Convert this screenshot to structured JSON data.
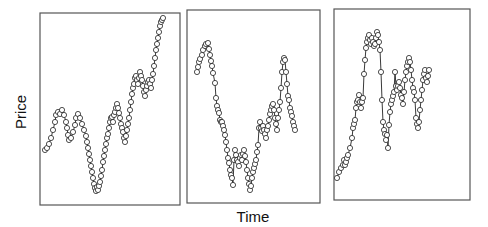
{
  "chart_data": {
    "type": "line",
    "title": "",
    "xlabel": "Time",
    "ylabel": "Price",
    "grid": false,
    "legend": null,
    "markers": "open-circle",
    "axis_ticks": false,
    "panels": [
      {
        "name": "panel-1",
        "frame": [
          40,
          13,
          180,
          205
        ],
        "points": [
          [
            45,
            150
          ],
          [
            47,
            148
          ],
          [
            49,
            144
          ],
          [
            51,
            138
          ],
          [
            53,
            130
          ],
          [
            55,
            122
          ],
          [
            56,
            115
          ],
          [
            58,
            112
          ],
          [
            60,
            114
          ],
          [
            62,
            110
          ],
          [
            64,
            115
          ],
          [
            66,
            122
          ],
          [
            67,
            128
          ],
          [
            68,
            135
          ],
          [
            69,
            140
          ],
          [
            71,
            138
          ],
          [
            73,
            132
          ],
          [
            75,
            125
          ],
          [
            76,
            118
          ],
          [
            78,
            114
          ],
          [
            80,
            118
          ],
          [
            82,
            124
          ],
          [
            84,
            130
          ],
          [
            86,
            136
          ],
          [
            87,
            142
          ],
          [
            88,
            148
          ],
          [
            89,
            154
          ],
          [
            90,
            160
          ],
          [
            91,
            166
          ],
          [
            92,
            172
          ],
          [
            93,
            178
          ],
          [
            94,
            184
          ],
          [
            95,
            188
          ],
          [
            96,
            191
          ],
          [
            97,
            187
          ],
          [
            98,
            190
          ],
          [
            99,
            186
          ],
          [
            100,
            182
          ],
          [
            101,
            176
          ],
          [
            102,
            170
          ],
          [
            103,
            162
          ],
          [
            104,
            156
          ],
          [
            105,
            150
          ],
          [
            106,
            144
          ],
          [
            107,
            138
          ],
          [
            108,
            134
          ],
          [
            109,
            128
          ],
          [
            110,
            122
          ],
          [
            111,
            118
          ],
          [
            112,
            117
          ],
          [
            113,
            122
          ],
          [
            114,
            115
          ],
          [
            115,
            112
          ],
          [
            116,
            108
          ],
          [
            117,
            104
          ],
          [
            118,
            108
          ],
          [
            119,
            113
          ],
          [
            120,
            118
          ],
          [
            121,
            124
          ],
          [
            122,
            128
          ],
          [
            123,
            132
          ],
          [
            124,
            138
          ],
          [
            125,
            142
          ],
          [
            126,
            136
          ],
          [
            127,
            130
          ],
          [
            128,
            124
          ],
          [
            129,
            118
          ],
          [
            130,
            110
          ],
          [
            131,
            102
          ],
          [
            132,
            94
          ],
          [
            133,
            88
          ],
          [
            134,
            84
          ],
          [
            135,
            78
          ],
          [
            136,
            76
          ],
          [
            137,
            80
          ],
          [
            138,
            84
          ],
          [
            139,
            78
          ],
          [
            140,
            72
          ],
          [
            141,
            76
          ],
          [
            142,
            80
          ],
          [
            143,
            86
          ],
          [
            144,
            92
          ],
          [
            145,
            96
          ],
          [
            146,
            90
          ],
          [
            147,
            86
          ],
          [
            148,
            82
          ],
          [
            149,
            80
          ],
          [
            150,
            84
          ],
          [
            151,
            88
          ],
          [
            152,
            80
          ],
          [
            153,
            74
          ],
          [
            154,
            66
          ],
          [
            155,
            58
          ],
          [
            156,
            50
          ],
          [
            157,
            44
          ],
          [
            158,
            38
          ],
          [
            159,
            32
          ],
          [
            160,
            26
          ],
          [
            161,
            22
          ],
          [
            162,
            20
          ],
          [
            163,
            18
          ]
        ]
      },
      {
        "name": "panel-2",
        "frame": [
          187,
          10,
          320,
          203
        ],
        "points": [
          [
            197,
            72
          ],
          [
            198,
            67
          ],
          [
            199,
            62
          ],
          [
            200,
            59
          ],
          [
            202,
            55
          ],
          [
            203,
            50
          ],
          [
            205,
            46
          ],
          [
            206,
            44
          ],
          [
            208,
            43
          ],
          [
            209,
            49
          ],
          [
            210,
            55
          ],
          [
            211,
            61
          ],
          [
            212,
            66
          ],
          [
            213,
            73
          ],
          [
            215,
            83
          ],
          [
            216,
            98
          ],
          [
            217,
            106
          ],
          [
            218,
            110
          ],
          [
            219,
            113
          ],
          [
            220,
            120
          ],
          [
            221,
            122
          ],
          [
            222,
            122
          ],
          [
            223,
            126
          ],
          [
            224,
            130
          ],
          [
            225,
            135
          ],
          [
            226,
            142
          ],
          [
            227,
            150
          ],
          [
            228,
            158
          ],
          [
            229,
            163
          ],
          [
            230,
            170
          ],
          [
            231,
            175
          ],
          [
            232,
            178
          ],
          [
            233,
            185
          ],
          [
            234,
            160
          ],
          [
            235,
            150
          ],
          [
            236,
            155
          ],
          [
            237,
            160
          ],
          [
            238,
            162
          ],
          [
            239,
            166
          ],
          [
            240,
            158
          ],
          [
            241,
            155
          ],
          [
            242,
            160
          ],
          [
            243,
            154
          ],
          [
            244,
            150
          ],
          [
            245,
            156
          ],
          [
            246,
            162
          ],
          [
            247,
            170
          ],
          [
            248,
            178
          ],
          [
            249,
            184
          ],
          [
            250,
            190
          ],
          [
            251,
            186
          ],
          [
            252,
            178
          ],
          [
            253,
            172
          ],
          [
            254,
            168
          ],
          [
            255,
            164
          ],
          [
            256,
            160
          ],
          [
            257,
            152
          ],
          [
            258,
            145
          ],
          [
            259,
            128
          ],
          [
            260,
            122
          ],
          [
            261,
            128
          ],
          [
            262,
            131
          ],
          [
            263,
            126
          ],
          [
            264,
            130
          ],
          [
            265,
            134
          ],
          [
            266,
            138
          ],
          [
            267,
            130
          ],
          [
            268,
            126
          ],
          [
            269,
            120
          ],
          [
            270,
            114
          ],
          [
            271,
            110
          ],
          [
            272,
            106
          ],
          [
            273,
            104
          ],
          [
            274,
            110
          ],
          [
            275,
            118
          ],
          [
            276,
            124
          ],
          [
            277,
            130
          ],
          [
            278,
            118
          ],
          [
            279,
            110
          ],
          [
            280,
            102
          ],
          [
            281,
            88
          ],
          [
            282,
            72
          ],
          [
            283,
            62
          ],
          [
            284,
            58
          ],
          [
            285,
            60
          ],
          [
            286,
            72
          ],
          [
            287,
            84
          ],
          [
            288,
            96
          ],
          [
            289,
            100
          ],
          [
            290,
            108
          ],
          [
            291,
            112
          ],
          [
            292,
            116
          ],
          [
            293,
            122
          ],
          [
            294,
            126
          ],
          [
            295,
            130
          ]
        ]
      },
      {
        "name": "panel-3",
        "frame": [
          334,
          9,
          470,
          200
        ],
        "points": [
          [
            337,
            178
          ],
          [
            339,
            172
          ],
          [
            341,
            168
          ],
          [
            343,
            165
          ],
          [
            344,
            160
          ],
          [
            345,
            165
          ],
          [
            346,
            162
          ],
          [
            347,
            158
          ],
          [
            348,
            155
          ],
          [
            350,
            148
          ],
          [
            352,
            138
          ],
          [
            353,
            128
          ],
          [
            354,
            124
          ],
          [
            355,
            120
          ],
          [
            356,
            108
          ],
          [
            357,
            102
          ],
          [
            358,
            100
          ],
          [
            359,
            95
          ],
          [
            360,
            102
          ],
          [
            361,
            108
          ],
          [
            362,
            102
          ],
          [
            363,
            98
          ],
          [
            364,
            74
          ],
          [
            365,
            60
          ],
          [
            366,
            48
          ],
          [
            367,
            42
          ],
          [
            368,
            38
          ],
          [
            369,
            35
          ],
          [
            370,
            40
          ],
          [
            371,
            44
          ],
          [
            372,
            38
          ],
          [
            373,
            42
          ],
          [
            374,
            46
          ],
          [
            375,
            44
          ],
          [
            376,
            38
          ],
          [
            377,
            32
          ],
          [
            378,
            35
          ],
          [
            379,
            42
          ],
          [
            380,
            50
          ],
          [
            381,
            72
          ],
          [
            382,
            100
          ],
          [
            383,
            122
          ],
          [
            384,
            130
          ],
          [
            385,
            134
          ],
          [
            386,
            140
          ],
          [
            387,
            135
          ],
          [
            388,
            148
          ],
          [
            389,
            125
          ],
          [
            390,
            112
          ],
          [
            391,
            104
          ],
          [
            392,
            100
          ],
          [
            393,
            96
          ],
          [
            394,
            92
          ],
          [
            395,
            72
          ],
          [
            396,
            86
          ],
          [
            397,
            90
          ],
          [
            398,
            86
          ],
          [
            399,
            82
          ],
          [
            400,
            88
          ],
          [
            401,
            95
          ],
          [
            402,
            98
          ],
          [
            403,
            104
          ],
          [
            404,
            92
          ],
          [
            405,
            80
          ],
          [
            406,
            72
          ],
          [
            407,
            66
          ],
          [
            408,
            62
          ],
          [
            409,
            58
          ],
          [
            410,
            62
          ],
          [
            411,
            70
          ],
          [
            412,
            80
          ],
          [
            413,
            88
          ],
          [
            414,
            92
          ],
          [
            415,
            100
          ],
          [
            416,
            118
          ],
          [
            417,
            124
          ],
          [
            418,
            128
          ],
          [
            419,
            122
          ],
          [
            420,
            110
          ],
          [
            421,
            100
          ],
          [
            422,
            90
          ],
          [
            423,
            80
          ],
          [
            424,
            74
          ],
          [
            425,
            70
          ],
          [
            426,
            78
          ],
          [
            427,
            82
          ],
          [
            428,
            76
          ],
          [
            429,
            70
          ]
        ]
      }
    ]
  }
}
